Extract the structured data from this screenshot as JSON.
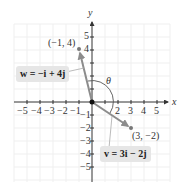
{
  "figure": {
    "axes": {
      "x_label": "x",
      "y_label": "y",
      "x_ticks": [
        "−5",
        "−4",
        "−3",
        "−2",
        "−1",
        "1",
        "2",
        "3",
        "4",
        "5"
      ],
      "y_ticks_pos": [
        "5",
        "4"
      ],
      "y_ticks_neg": [
        "−1",
        "−2",
        "−3",
        "−4",
        "−5"
      ],
      "range": [
        -5,
        5
      ]
    },
    "points": [
      {
        "label": "(−1, 4)",
        "x": -1,
        "y": 4
      },
      {
        "label": "(3, −2)",
        "x": 3,
        "y": -2
      }
    ],
    "vectors": [
      {
        "name": "w",
        "label": "w = −i + 4j",
        "from": [
          0,
          0
        ],
        "to": [
          -1,
          4
        ]
      },
      {
        "name": "v",
        "label": "v = 3i − 2j",
        "from": [
          0,
          0
        ],
        "to": [
          3,
          -2
        ]
      }
    ],
    "angle_label": "θ",
    "colors": {
      "vector": "#8c8c8c",
      "axis": "#333333",
      "grid": "#eeeeee",
      "label_box": "#e6e6e6"
    }
  }
}
